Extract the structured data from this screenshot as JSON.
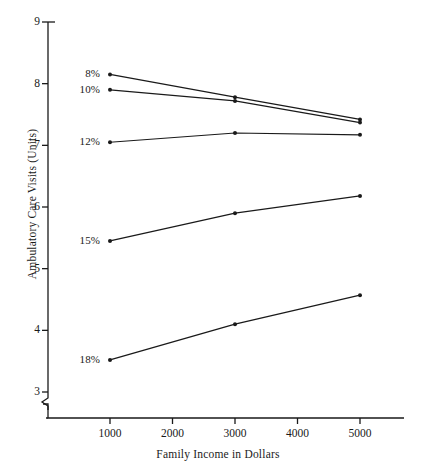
{
  "chart_data": {
    "type": "line",
    "title": "",
    "subtitle": "",
    "xlabel": "Family Income in Dollars",
    "ylabel": "Ambulatory Care Visits (Units)",
    "x": [
      1000,
      3000,
      5000
    ],
    "xlim": [
      500,
      5500
    ],
    "ylim": [
      3,
      9
    ],
    "yticks": [
      3,
      4,
      5,
      6,
      7,
      8,
      9
    ],
    "ytick_labels": [
      "3",
      "4",
      "5",
      "6",
      "7",
      "8",
      "9"
    ],
    "xticks": [
      1000,
      2000,
      3000,
      4000,
      5000
    ],
    "xtick_labels": [
      "1000",
      "2000",
      "3000",
      "4000",
      "5000"
    ],
    "grid": false,
    "legend_position": "inline-left-labels",
    "axis_break": "y-axis broken below 3",
    "markers": "filled-dot",
    "line_color": "#1a1a1a",
    "series": [
      {
        "name": "8%",
        "label": "8%",
        "values": [
          8.15,
          7.78,
          7.42
        ]
      },
      {
        "name": "10%",
        "label": "10%",
        "values": [
          7.9,
          7.72,
          7.37
        ]
      },
      {
        "name": "12%",
        "label": "12%",
        "values": [
          7.05,
          7.2,
          7.17
        ]
      },
      {
        "name": "15%",
        "label": "15%",
        "values": [
          5.45,
          5.9,
          6.18
        ]
      },
      {
        "name": "18%",
        "label": "18%",
        "values": [
          3.52,
          4.1,
          4.57
        ]
      }
    ]
  }
}
